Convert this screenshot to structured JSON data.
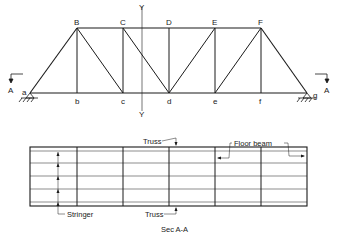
{
  "colors": {
    "line": "#1a1a1a",
    "thin": "#555555",
    "background": "#ffffff"
  },
  "elevation": {
    "top_nodes": [
      {
        "label": "B",
        "x": 77
      },
      {
        "label": "C",
        "x": 123
      },
      {
        "label": "D",
        "x": 169
      },
      {
        "label": "E",
        "x": 215
      },
      {
        "label": "F",
        "x": 261
      }
    ],
    "bottom_nodes": [
      {
        "label": "a",
        "x": 30
      },
      {
        "label": "b",
        "x": 77
      },
      {
        "label": "c",
        "x": 123
      },
      {
        "label": "d",
        "x": 169
      },
      {
        "label": "e",
        "x": 215
      },
      {
        "label": "f",
        "x": 261
      },
      {
        "label": "g",
        "x": 307
      }
    ],
    "axis_label_top": "Y",
    "axis_label_bottom": "Y",
    "section_left": "A",
    "section_right": "A"
  },
  "plan": {
    "label_truss_top": "Truss",
    "label_truss_bottom": "Truss",
    "label_floor_beam": "Floor beam",
    "label_stringer": "Stringer",
    "caption": "Sec A-A"
  }
}
